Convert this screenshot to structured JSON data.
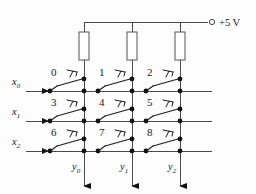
{
  "figure": {
    "supply_label": "+5 V",
    "supply_terminal_icon": "open-circle-terminal-icon"
  },
  "colors": {
    "wire": "#4a4a4a",
    "wire_dark": "#333333",
    "node": "#111111",
    "resistor_stroke": "#555555",
    "background": "#fdfdfd",
    "label": "#1a1a1a"
  },
  "rows": [
    {
      "id": "x0",
      "base": "x",
      "sub": "0",
      "y": 91
    },
    {
      "id": "x1",
      "base": "x",
      "sub": "1",
      "y": 121
    },
    {
      "id": "x2",
      "base": "x",
      "sub": "2",
      "y": 151
    }
  ],
  "columns": [
    {
      "id": "y0",
      "base": "y",
      "sub": "0",
      "x": 84
    },
    {
      "id": "y1",
      "base": "y",
      "sub": "1",
      "x": 132
    },
    {
      "id": "y2",
      "base": "y",
      "sub": "2",
      "x": 180
    }
  ],
  "resistors": [
    {
      "id": "r0",
      "x": 84
    },
    {
      "id": "r1",
      "x": 132
    },
    {
      "id": "r2",
      "x": 180
    }
  ],
  "switches": [
    {
      "label": "0",
      "row": 0,
      "col": 0
    },
    {
      "label": "1",
      "row": 0,
      "col": 1
    },
    {
      "label": "2",
      "row": 0,
      "col": 2
    },
    {
      "label": "3",
      "row": 1,
      "col": 0
    },
    {
      "label": "4",
      "row": 1,
      "col": 1
    },
    {
      "label": "5",
      "row": 1,
      "col": 2
    },
    {
      "label": "6",
      "row": 2,
      "col": 0
    },
    {
      "label": "7",
      "row": 2,
      "col": 1
    },
    {
      "label": "8",
      "row": 2,
      "col": 2
    }
  ],
  "geometry": {
    "top_rail_y": 22,
    "resistor_top": 32,
    "resistor_bottom": 60,
    "resistor_width": 10,
    "column_bottom": 186,
    "row_left_x": 26,
    "row_right_x": 212,
    "supply_terminal_x": 212,
    "supply_label_x": 219,
    "pivot_offset": -34,
    "contact_dy": -12
  }
}
